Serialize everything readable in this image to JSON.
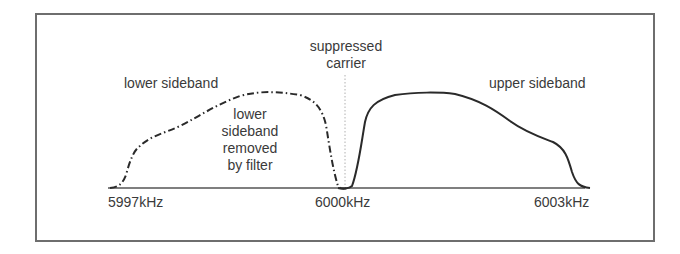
{
  "diagram": {
    "labels": {
      "lower_sideband": "lower sideband",
      "upper_sideband": "upper sideband",
      "suppressed_carrier_line1": "suppressed",
      "suppressed_carrier_line2": "carrier",
      "removed_line1": "lower",
      "removed_line2": "sideband",
      "removed_line3": "removed",
      "removed_line4": "by filter"
    },
    "axis": {
      "ticks": [
        "5997kHz",
        "6000kHz",
        "6003kHz"
      ]
    },
    "colors": {
      "curve": "#2a2a2a",
      "frame": "#6e6e6e",
      "text": "#3a3a3a",
      "carrier_line": "#b0b0b0"
    },
    "curves": [
      {
        "name": "lower sideband (removed)",
        "style": "dash-dot"
      },
      {
        "name": "upper sideband",
        "style": "solid"
      }
    ]
  }
}
